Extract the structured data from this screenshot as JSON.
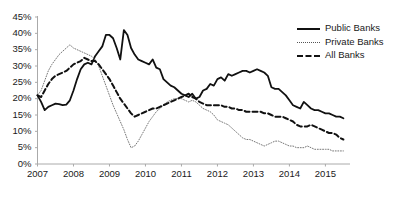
{
  "chart_data": {
    "type": "line",
    "title": "",
    "xlabel": "",
    "ylabel": "",
    "xlim": [
      2007.0,
      2015.6
    ],
    "ylim": [
      0,
      45
    ],
    "grid": false,
    "legend_position": "top-right",
    "ytick_labels": [
      "45%",
      "40%",
      "35%",
      "30%",
      "25%",
      "20%",
      "15%",
      "10%",
      "5%",
      "0%"
    ],
    "ytick_values": [
      45,
      40,
      35,
      30,
      25,
      20,
      15,
      10,
      5,
      0
    ],
    "xtick_labels": [
      "2007",
      "2008",
      "2009",
      "2010",
      "2011",
      "2012",
      "2013",
      "2014",
      "2015"
    ],
    "xtick_values": [
      2007,
      2008,
      2009,
      2010,
      2011,
      2012,
      2013,
      2014,
      2015
    ],
    "x": [
      2007.0,
      2007.1,
      2007.2,
      2007.3,
      2007.4,
      2007.5,
      2007.6,
      2007.7,
      2007.8,
      2007.9,
      2008.0,
      2008.1,
      2008.2,
      2008.3,
      2008.4,
      2008.5,
      2008.6,
      2008.7,
      2008.8,
      2008.9,
      2009.0,
      2009.1,
      2009.2,
      2009.3,
      2009.4,
      2009.5,
      2009.6,
      2009.7,
      2009.8,
      2009.9,
      2010.0,
      2010.1,
      2010.2,
      2010.3,
      2010.4,
      2010.5,
      2010.6,
      2010.7,
      2010.8,
      2010.9,
      2011.0,
      2011.1,
      2011.2,
      2011.3,
      2011.4,
      2011.5,
      2011.6,
      2011.7,
      2011.8,
      2011.9,
      2012.0,
      2012.1,
      2012.2,
      2012.3,
      2012.4,
      2012.5,
      2012.6,
      2012.7,
      2012.8,
      2012.9,
      2013.0,
      2013.1,
      2013.2,
      2013.3,
      2013.4,
      2013.5,
      2013.6,
      2013.7,
      2013.8,
      2013.9,
      2014.0,
      2014.1,
      2014.2,
      2014.3,
      2014.4,
      2014.5,
      2014.6,
      2014.7,
      2014.8,
      2014.9,
      2015.0,
      2015.1,
      2015.2,
      2015.3,
      2015.4,
      2015.5
    ],
    "series": [
      {
        "name": "Public Banks",
        "style": "solid",
        "color": "#111111",
        "values": [
          21.0,
          19.0,
          16.5,
          17.5,
          18.0,
          18.5,
          18.3,
          18.0,
          18.2,
          19.5,
          22.5,
          26.0,
          29.0,
          30.5,
          31.0,
          30.5,
          33.0,
          34.5,
          36.0,
          39.5,
          39.5,
          38.5,
          35.5,
          32.0,
          41.0,
          39.5,
          35.5,
          33.5,
          32.0,
          31.5,
          31.0,
          30.5,
          32.0,
          29.5,
          29.0,
          26.0,
          25.0,
          24.0,
          23.5,
          22.5,
          21.5,
          21.0,
          20.5,
          21.5,
          20.0,
          20.5,
          22.5,
          23.0,
          24.5,
          24.0,
          26.0,
          26.5,
          25.5,
          27.5,
          27.0,
          27.5,
          28.0,
          28.5,
          28.5,
          28.0,
          28.5,
          29.0,
          28.5,
          28.0,
          27.0,
          23.5,
          23.0,
          23.0,
          22.0,
          21.0,
          19.5,
          18.0,
          17.5,
          17.0,
          19.0,
          18.0,
          17.0,
          16.5,
          16.5,
          16.0,
          15.5,
          15.5,
          15.0,
          14.5,
          14.5,
          14.0
        ]
      },
      {
        "name": "Private Banks",
        "style": "dotted",
        "color": "#777777",
        "values": [
          21.0,
          22.5,
          25.5,
          28.5,
          30.5,
          32.0,
          33.5,
          34.5,
          35.5,
          36.5,
          35.5,
          35.0,
          34.5,
          34.0,
          33.5,
          33.0,
          32.0,
          30.0,
          27.0,
          24.0,
          21.0,
          18.0,
          15.5,
          13.0,
          10.5,
          7.5,
          5.0,
          5.5,
          7.0,
          9.0,
          11.0,
          13.0,
          14.5,
          16.0,
          17.0,
          18.0,
          19.0,
          19.5,
          20.0,
          20.0,
          20.0,
          19.5,
          19.0,
          19.5,
          19.0,
          18.0,
          17.0,
          16.5,
          16.0,
          15.0,
          13.5,
          13.0,
          12.5,
          12.0,
          11.0,
          10.0,
          9.0,
          8.0,
          7.5,
          7.5,
          7.0,
          6.5,
          6.0,
          5.5,
          6.0,
          6.5,
          7.0,
          7.0,
          6.5,
          6.0,
          5.5,
          5.5,
          5.0,
          5.0,
          5.0,
          5.5,
          5.0,
          4.5,
          4.5,
          4.5,
          4.5,
          4.5,
          4.0,
          4.0,
          4.0,
          4.0
        ]
      },
      {
        "name": "All Banks",
        "style": "dashed",
        "color": "#111111",
        "values": [
          21.0,
          20.5,
          22.5,
          24.5,
          26.0,
          27.0,
          27.5,
          28.0,
          28.5,
          29.5,
          30.5,
          31.0,
          31.5,
          32.5,
          32.0,
          31.5,
          31.5,
          30.5,
          29.0,
          27.5,
          26.0,
          24.0,
          22.0,
          20.0,
          18.5,
          17.0,
          15.5,
          14.5,
          15.0,
          15.5,
          16.0,
          16.5,
          17.0,
          17.0,
          17.5,
          18.0,
          18.5,
          19.0,
          19.5,
          20.0,
          20.5,
          21.0,
          21.5,
          20.5,
          20.0,
          19.0,
          18.5,
          18.0,
          18.0,
          18.0,
          18.0,
          18.0,
          17.5,
          17.5,
          17.0,
          17.0,
          16.5,
          16.5,
          16.0,
          16.0,
          16.0,
          16.0,
          16.0,
          15.5,
          15.5,
          15.0,
          14.5,
          14.5,
          14.5,
          14.0,
          13.5,
          13.0,
          12.0,
          11.5,
          11.5,
          11.5,
          12.0,
          11.5,
          11.0,
          10.5,
          10.0,
          9.5,
          9.5,
          9.0,
          8.0,
          7.5
        ]
      }
    ]
  },
  "legend": {
    "items": [
      {
        "label": "Public Banks"
      },
      {
        "label": "Private Banks"
      },
      {
        "label": "All Banks"
      }
    ]
  }
}
